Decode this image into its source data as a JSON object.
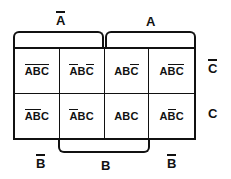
{
  "diagram": {
    "type": "karnaugh-map",
    "variables": [
      "A",
      "B",
      "C"
    ],
    "rows": 2,
    "columns": 4
  },
  "cells": [
    {
      "id": "cell-r1c1",
      "literals": [
        {
          "letter": "A",
          "bar": true
        },
        {
          "letter": "B",
          "bar": true
        },
        {
          "letter": "C",
          "bar": true
        }
      ]
    },
    {
      "id": "cell-r1c2",
      "literals": [
        {
          "letter": "A",
          "bar": true
        },
        {
          "letter": "B",
          "bar": false
        },
        {
          "letter": "C",
          "bar": true
        }
      ]
    },
    {
      "id": "cell-r1c3",
      "literals": [
        {
          "letter": "A",
          "bar": false
        },
        {
          "letter": "B",
          "bar": false
        },
        {
          "letter": "C",
          "bar": true
        }
      ]
    },
    {
      "id": "cell-r1c4",
      "literals": [
        {
          "letter": "A",
          "bar": false
        },
        {
          "letter": "B",
          "bar": true
        },
        {
          "letter": "C",
          "bar": true
        }
      ]
    },
    {
      "id": "cell-r2c1",
      "literals": [
        {
          "letter": "A",
          "bar": true
        },
        {
          "letter": "B",
          "bar": true
        },
        {
          "letter": "C",
          "bar": false
        }
      ]
    },
    {
      "id": "cell-r2c2",
      "literals": [
        {
          "letter": "A",
          "bar": true
        },
        {
          "letter": "B",
          "bar": false
        },
        {
          "letter": "C",
          "bar": false
        }
      ]
    },
    {
      "id": "cell-r2c3",
      "literals": [
        {
          "letter": "A",
          "bar": false
        },
        {
          "letter": "B",
          "bar": false
        },
        {
          "letter": "C",
          "bar": false
        }
      ]
    },
    {
      "id": "cell-r2c4",
      "literals": [
        {
          "letter": "A",
          "bar": false
        },
        {
          "letter": "B",
          "bar": true
        },
        {
          "letter": "C",
          "bar": false
        }
      ]
    }
  ],
  "labels": {
    "top_left": {
      "letter": "A",
      "bar": true
    },
    "top_right": {
      "letter": "A",
      "bar": false
    },
    "right_top": {
      "letter": "C",
      "bar": true
    },
    "right_bottom": {
      "letter": "C",
      "bar": false
    },
    "bottom_left": {
      "letter": "B",
      "bar": true
    },
    "bottom_center": {
      "letter": "B",
      "bar": false
    },
    "bottom_right": {
      "letter": "B",
      "bar": true
    }
  },
  "colors": {
    "ink": "#111111",
    "paper": "#ffffff"
  }
}
